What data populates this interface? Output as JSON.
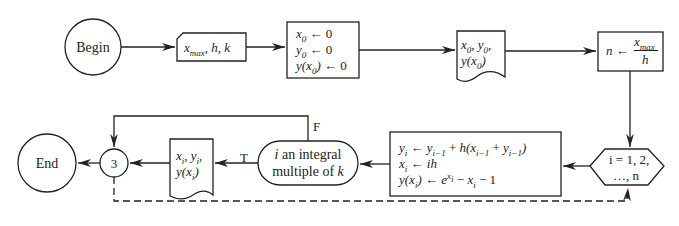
{
  "diagram": {
    "type": "flowchart",
    "nodes": [
      {
        "id": "begin",
        "shape": "circle",
        "label": "Begin"
      },
      {
        "id": "input",
        "shape": "input-card",
        "label": "x_max, h, k"
      },
      {
        "id": "init",
        "shape": "process",
        "lines": [
          "x0 ← 0",
          "y0 ← 0",
          "y(x0) ← 0"
        ]
      },
      {
        "id": "print-init",
        "shape": "document",
        "lines": [
          "x0, y0,",
          "y(x0)"
        ]
      },
      {
        "id": "compute-n",
        "shape": "process",
        "label": "n ← x_max / h"
      },
      {
        "id": "loop",
        "shape": "hexagon",
        "lines": [
          "i = 1, 2,",
          "…, n"
        ]
      },
      {
        "id": "update",
        "shape": "process",
        "lines": [
          "yi ← yi−1 + h(xi−1 + yi−1)",
          "xi ← ih",
          "y(xi) ← e^xi − xi − 1"
        ]
      },
      {
        "id": "decision",
        "shape": "terminal-rounded",
        "lines": [
          "i an integral",
          "multiple of k"
        ]
      },
      {
        "id": "print-loop",
        "shape": "document",
        "lines": [
          "xi, yi,",
          "y(xi)"
        ]
      },
      {
        "id": "connector",
        "shape": "small-circle",
        "label": "3"
      },
      {
        "id": "end",
        "shape": "circle",
        "label": "End"
      }
    ],
    "edges": [
      {
        "from": "begin",
        "to": "input"
      },
      {
        "from": "input",
        "to": "init"
      },
      {
        "from": "init",
        "to": "print-init"
      },
      {
        "from": "print-init",
        "to": "compute-n"
      },
      {
        "from": "compute-n",
        "to": "loop"
      },
      {
        "from": "loop",
        "to": "update"
      },
      {
        "from": "update",
        "to": "decision"
      },
      {
        "from": "decision",
        "to": "print-loop",
        "label": "T"
      },
      {
        "from": "decision",
        "to": "connector",
        "label": "F"
      },
      {
        "from": "print-loop",
        "to": "connector"
      },
      {
        "from": "connector",
        "to": "end"
      },
      {
        "from": "connector",
        "to": "loop",
        "style": "dashed"
      }
    ],
    "labels": {
      "begin": "Begin",
      "end": "End",
      "connector": "3",
      "true": "T",
      "false": "F",
      "decision_l1": "i an integral",
      "decision_l2": "multiple of",
      "decision_k": "k",
      "loop_l1": "i = 1, 2,",
      "loop_l2": "…, n",
      "colors": {
        "stroke": "#222222",
        "background": "#ffffff"
      }
    }
  }
}
